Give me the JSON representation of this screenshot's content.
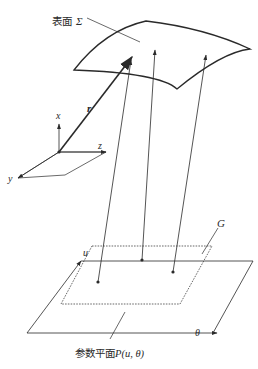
{
  "figure": {
    "type": "parametric-surface-mapping",
    "labels": {
      "surface": "表面",
      "surface_symbol": "Σ",
      "position_vector": "r",
      "axis_x": "x",
      "axis_y": "y",
      "axis_z": "z",
      "domain": "G",
      "axis_u": "u",
      "axis_theta": "θ",
      "parameter_plane": "参数平面",
      "parameter_plane_func": "P(u, θ)"
    },
    "colors": {
      "line": "#2a2a2a",
      "background": "#ffffff"
    }
  }
}
